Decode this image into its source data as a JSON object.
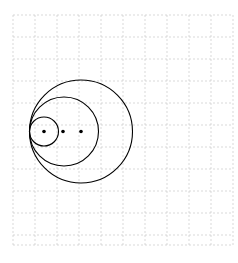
{
  "figure": {
    "background_color": "#ffffff",
    "canvas": {
      "width": 238,
      "height": 263
    }
  },
  "grid": {
    "visible": true,
    "style": "dashed",
    "color": "#c8c8c8",
    "line_width": 0.7,
    "dash_pattern": "2 2",
    "cell_size": 22,
    "x_start": 13,
    "x_end": 233,
    "y_start": 15,
    "y_end": 245,
    "x_lines": [
      13,
      35,
      57,
      79,
      101,
      123,
      145,
      167,
      189,
      211,
      233
    ],
    "y_lines": [
      15,
      37,
      59,
      81,
      103,
      125,
      147,
      169,
      191,
      213,
      235,
      245
    ],
    "border_color": "#bdbdbd"
  },
  "chart_data": {
    "type": "scatter",
    "xlabel": "",
    "ylabel": "",
    "grid": true,
    "legend_position": "none",
    "xlim": [
      13,
      233
    ],
    "ylim": [
      15,
      245
    ],
    "tangent_point": {
      "x": 29.5,
      "y": 131.5
    },
    "baseline_y": 131.5,
    "circles": [
      {
        "name": "small-circle",
        "cx": 44,
        "cy": 131.5,
        "r": 14.5,
        "stroke": "#000000",
        "stroke_width": 1.1,
        "fill": "none"
      },
      {
        "name": "middle-circle",
        "cx": 64,
        "cy": 131.5,
        "r": 34.5,
        "stroke": "#000000",
        "stroke_width": 1.1,
        "fill": "none"
      },
      {
        "name": "large-circle",
        "cx": 81,
        "cy": 131.5,
        "r": 51.5,
        "stroke": "#000000",
        "stroke_width": 1.1,
        "fill": "none"
      }
    ],
    "center_points": [
      {
        "name": "small-circle-center",
        "x": 44,
        "y": 131.5,
        "radius": 1.8,
        "color": "#000000"
      },
      {
        "name": "middle-circle-center",
        "x": 63,
        "y": 131.5,
        "radius": 1.8,
        "color": "#000000"
      },
      {
        "name": "large-circle-center",
        "x": 81,
        "y": 131.5,
        "radius": 1.8,
        "color": "#000000"
      }
    ]
  }
}
